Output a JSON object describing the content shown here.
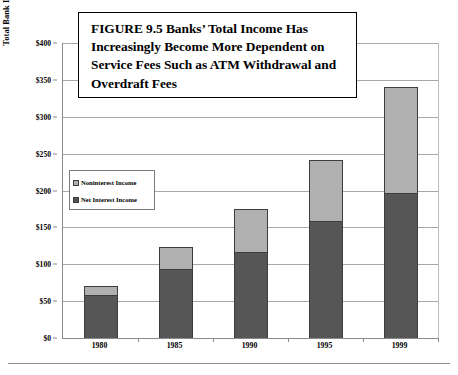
{
  "figure": {
    "title": "FIGURE 9.5  Banks’ Total Income Has Increasingly Become More Dependent on Service Fees Such as ATM Withdrawal and Overdraft Fees"
  },
  "axes": {
    "y_title": "Total Bank Interest Income and Fee Income (In Billions of Dollars)",
    "y_ticks": [
      "$0",
      "$50",
      "$100",
      "$150",
      "$200",
      "$250",
      "$300",
      "$350",
      "$400"
    ],
    "x_ticks": [
      "1980",
      "1985",
      "1990",
      "1995",
      "1999"
    ]
  },
  "legend": {
    "items": [
      {
        "label": "Noninterest Income",
        "color": "#b0b0b0"
      },
      {
        "label": "Net Interest Income",
        "color": "#565656"
      }
    ]
  },
  "chart_data": {
    "type": "bar",
    "subtype": "stacked-vertical",
    "title": "FIGURE 9.5  Banks’ Total Income Has Increasingly Become More Dependent on Service Fees Such as ATM Withdrawal and Overdraft Fees",
    "xlabel": "",
    "ylabel": "Total Bank Interest Income and Fee Income (In Billions of Dollars)",
    "categories": [
      "1980",
      "1985",
      "1990",
      "1995",
      "1999"
    ],
    "series": [
      {
        "name": "Net Interest Income",
        "color": "#565656",
        "values": [
          59,
          93,
          117,
          158,
          196
        ]
      },
      {
        "name": "Noninterest Income",
        "color": "#b0b0b0",
        "values": [
          11,
          30,
          58,
          83,
          145
        ]
      }
    ],
    "totals": [
      70,
      123,
      175,
      241,
      341
    ],
    "ylim": [
      0,
      400
    ],
    "ytick_step": 50,
    "ytick_values": [
      0,
      50,
      100,
      150,
      200,
      250,
      300,
      350,
      400
    ],
    "ytick_labels": [
      "$0",
      "$50",
      "$100",
      "$150",
      "$200",
      "$250",
      "$300",
      "$350",
      "$400"
    ],
    "units": "Billions of Dollars",
    "grid": "horizontal",
    "legend_position": "inside-left"
  }
}
